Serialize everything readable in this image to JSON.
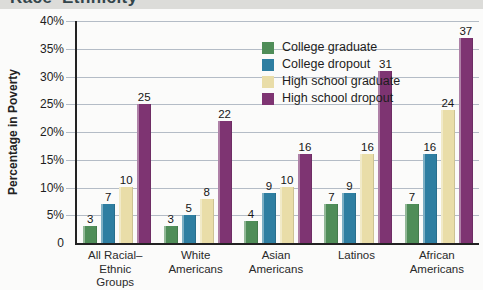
{
  "clipped_title_fragment": "Race–Ethnicity",
  "colors": {
    "gridline": "#b4bcc6",
    "axis": "#222222",
    "heading_strip_bg": "#dcdcd9",
    "heading_text": "#33454b"
  },
  "chart_data": {
    "type": "bar",
    "title": "",
    "ylabel": "Percentage in Poverty",
    "xlabel": "",
    "ylim": [
      0,
      40
    ],
    "ytick_step": 5,
    "ytick_labels": [
      "0",
      "5%",
      "10%",
      "15%",
      "20%",
      "25%",
      "30%",
      "35%",
      "40%"
    ],
    "grid": true,
    "legend_position": "top-left-inside",
    "categories": [
      [
        "All Racial–Ethnic",
        "Groups"
      ],
      [
        "White",
        "Americans"
      ],
      [
        "Asian",
        "Americans"
      ],
      [
        "Latinos"
      ],
      [
        "African",
        "Americans"
      ]
    ],
    "series": [
      {
        "name": "College graduate",
        "color": "#4f8d58",
        "values": [
          3,
          3,
          4,
          7,
          7
        ]
      },
      {
        "name": "College dropout",
        "color": "#2e7ea1",
        "values": [
          7,
          5,
          9,
          9,
          16
        ]
      },
      {
        "name": "High school graduate",
        "color": "#e9dda8",
        "values": [
          10,
          8,
          10,
          16,
          24
        ]
      },
      {
        "name": "High school dropout",
        "color": "#7e3472",
        "values": [
          25,
          22,
          16,
          31,
          37
        ]
      }
    ]
  }
}
